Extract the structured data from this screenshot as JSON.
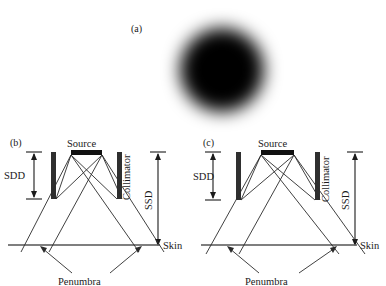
{
  "figure": {
    "panels": [
      {
        "id": "a",
        "label": "(a)",
        "type": "beam-spot-image",
        "description": "blurred black circular beam spot",
        "spot": {
          "cx": 222,
          "cy": 70,
          "radius": 43,
          "blur": 9,
          "color": "#000000"
        }
      },
      {
        "id": "b",
        "label": "(b)",
        "type": "beam-geometry-diagram",
        "labels": {
          "source": "Source",
          "collimator": "Collimator",
          "sdd": "SDD",
          "ssd": "SSD",
          "skin": "Skin",
          "penumbra": "Penumbra"
        }
      },
      {
        "id": "c",
        "label": "(c)",
        "type": "beam-geometry-diagram",
        "labels": {
          "source": "Source",
          "collimator": "Collimator",
          "sdd": "SDD",
          "ssd": "SSD",
          "skin": "Skin",
          "penumbra": "Penumbra"
        }
      }
    ],
    "colors": {
      "ink": "#1a1a1a",
      "ray": "#2b2b2b",
      "block": "#2f2f2f",
      "skin": "#555555",
      "spot": "#000000",
      "background": "#ffffff"
    }
  }
}
